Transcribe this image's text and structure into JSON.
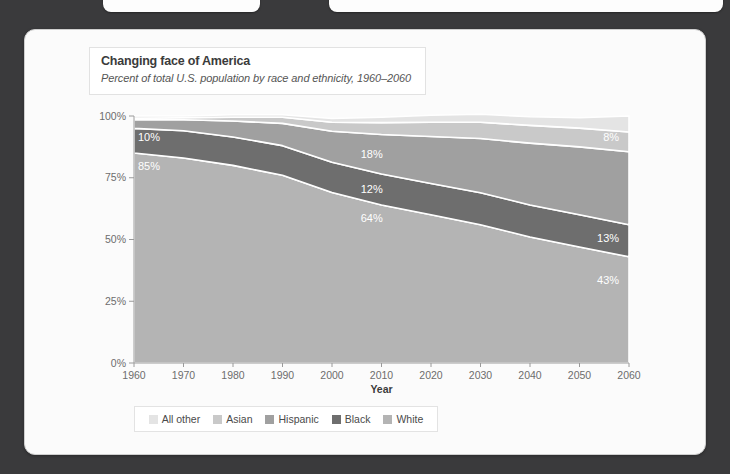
{
  "card": {
    "title": "Changing face of America",
    "subtitle": "Percent of total U.S. population by race and ethnicity, 1960–2060"
  },
  "colors": {
    "page_background": "#3a3a3c",
    "card_background": "#fbfbfb",
    "all_other": "#e4e4e4",
    "asian": "#c9c9c9",
    "hispanic": "#a0a0a0",
    "black": "#6e6e6e",
    "white_race": "#b4b4b4",
    "axis_text": "#6d6d6d",
    "label_text": "#ffffff"
  },
  "legend": {
    "position": "bottom",
    "items": [
      {
        "label": "All other",
        "color": "#e4e4e4"
      },
      {
        "label": "Asian",
        "color": "#c9c9c9"
      },
      {
        "label": "Hispanic",
        "color": "#a0a0a0"
      },
      {
        "label": "Black",
        "color": "#6e6e6e"
      },
      {
        "label": "White",
        "color": "#b4b4b4"
      }
    ]
  },
  "chart_data": {
    "type": "area",
    "stacked": true,
    "title": "Changing face of America",
    "subtitle": "Percent of total U.S. population by race and ethnicity, 1960–2060",
    "xlabel": "Year",
    "ylabel": "",
    "grid": false,
    "x": [
      1960,
      1970,
      1980,
      1990,
      2000,
      2010,
      2020,
      2030,
      2040,
      2050,
      2060
    ],
    "xlim": [
      1960,
      2060
    ],
    "ylim": [
      0,
      100
    ],
    "xticks": [
      "1960",
      "1970",
      "1980",
      "1990",
      "2000",
      "2010",
      "2020",
      "2030",
      "2040",
      "2050",
      "2060"
    ],
    "yticks": [
      "0%",
      "25%",
      "50%",
      "75%",
      "100%"
    ],
    "ytick_values": [
      0,
      25,
      50,
      75,
      100
    ],
    "stack_order_bottom_to_top": [
      "White",
      "Black",
      "Hispanic",
      "Asian",
      "All other"
    ],
    "series": [
      {
        "name": "White",
        "color": "#b4b4b4",
        "values": [
          85,
          83,
          80,
          76,
          69,
          64,
          60,
          56,
          51,
          47,
          43
        ]
      },
      {
        "name": "Black",
        "color": "#6e6e6e",
        "values": [
          10,
          11,
          11.5,
          12,
          12.3,
          12.5,
          12.7,
          12.9,
          13,
          13,
          13
        ]
      },
      {
        "name": "Hispanic",
        "color": "#a0a0a0",
        "values": [
          3.5,
          4.5,
          6.5,
          9,
          12.5,
          16,
          19,
          22,
          25,
          27.5,
          29.5
        ]
      },
      {
        "name": "Asian",
        "color": "#c9c9c9",
        "values": [
          0.6,
          0.8,
          1.5,
          2.5,
          3.7,
          4.8,
          5.8,
          6.6,
          7.2,
          7.6,
          8
        ]
      },
      {
        "name": "All other",
        "color": "#e4e4e4",
        "values": [
          0.9,
          0.7,
          1.0,
          1.0,
          1.5,
          2.2,
          2.8,
          3.2,
          3.5,
          4.2,
          6.5
        ]
      }
    ],
    "annotations": [
      {
        "text": "85%",
        "series": "White",
        "x": 1960,
        "y": 78
      },
      {
        "text": "10%",
        "series": "Black",
        "x": 1960,
        "y": 90
      },
      {
        "text": "64%",
        "series": "White",
        "x": 2005,
        "y": 57
      },
      {
        "text": "12%",
        "series": "Black",
        "x": 2005,
        "y": 69
      },
      {
        "text": "18%",
        "series": "Hispanic",
        "x": 2005,
        "y": 83
      },
      {
        "text": "43%",
        "series": "White",
        "x": 2058,
        "y": 32
      },
      {
        "text": "13%",
        "series": "Black",
        "x": 2058,
        "y": 49
      },
      {
        "text": "8%",
        "series": "Asian",
        "x": 2058,
        "y": 90
      }
    ]
  }
}
